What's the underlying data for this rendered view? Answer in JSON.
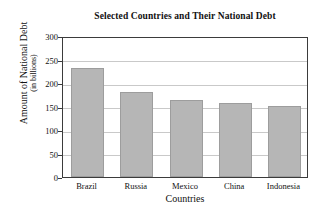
{
  "chart_data": {
    "type": "bar",
    "title": "Selected Countries and Their National Debt",
    "xlabel": "Countries",
    "ylabel": "Amount of National Debt",
    "ylabel_sub": "(in billions)",
    "categories": [
      "Brazil",
      "Russia",
      "Mexico",
      "China",
      "Indonesia"
    ],
    "values": [
      232,
      180,
      163,
      157,
      152
    ],
    "ylim": [
      0,
      300
    ],
    "yticks": [
      0,
      50,
      100,
      150,
      200,
      250,
      300
    ],
    "ytick_labels": [
      "0",
      "50",
      "100",
      "150",
      "200",
      "250",
      "300"
    ],
    "grid": true,
    "legend": null,
    "bar_color": "#b6b6b6",
    "bar_border_color": "#9d9d9d",
    "axis_color": "#3b3b3b",
    "grid_color": "#c9c9c9",
    "background": "#ffffff"
  }
}
